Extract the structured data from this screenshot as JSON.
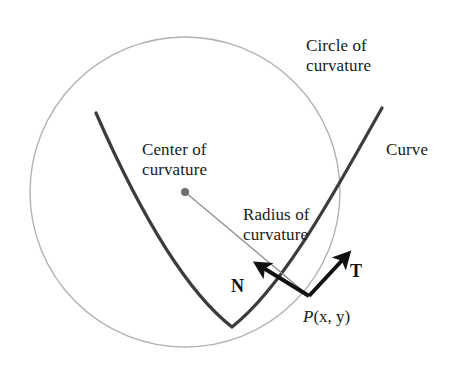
{
  "figure": {
    "background_color": "#ffffff",
    "width": 456,
    "height": 371,
    "labels": {
      "circle_of_curvature": "Circle of\ncurvature",
      "center_of_curvature": "Center of\ncurvature",
      "radius_of_curvature": "Radius of\ncurvature",
      "curve": "Curve",
      "tangent_vector": "T",
      "normal_vector": "N",
      "point_p": "P",
      "point_p_args": "(x, y)",
      "point_p_full": "P(x, y)"
    },
    "colors": {
      "circle": "#b2b2b2",
      "curve": "#3c3c3c",
      "radius_line": "#8c8c8c",
      "center_dot": "#6f6f6f",
      "vector_arrow": "#111111",
      "text": "#1a1a1a"
    },
    "geometry": {
      "circle": {
        "center_x": 185,
        "center_y": 192,
        "radius": 155,
        "stroke_width": 1.4
      },
      "center_dot": {
        "cx": 185,
        "cy": 192,
        "r": 4
      },
      "radius_line": {
        "x1": 185,
        "y1": 192,
        "x2": 309,
        "y2": 296,
        "stroke_width": 1.3
      },
      "tangent_point": {
        "x": 309,
        "y": 296
      },
      "tangent_arrow": {
        "x1": 309,
        "y1": 296,
        "x2": 353,
        "y2": 249,
        "stroke_width": 4
      },
      "normal_arrow": {
        "x1": 309,
        "y1": 296,
        "x2": 252,
        "y2": 261,
        "stroke_width": 4
      },
      "curve_path": "M 96 113 C 128 186 178 285 232 327 C 286 285 340 182 382 108",
      "curve_stroke_width": 3.2
    }
  }
}
